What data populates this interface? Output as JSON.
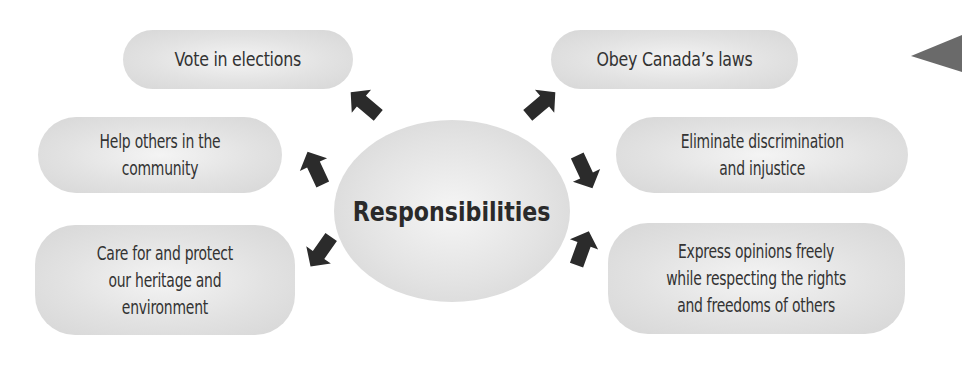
{
  "diagram": {
    "center": {
      "label": "Responsibilities"
    },
    "left": [
      {
        "label": "Vote in elections"
      },
      {
        "label_lines": [
          "Help others in the",
          "community"
        ]
      },
      {
        "label_lines": [
          "Care for and protect",
          "our heritage and",
          "environment"
        ]
      }
    ],
    "right": [
      {
        "label": "Obey Canada’s laws"
      },
      {
        "label_lines": [
          "Eliminate discrimination",
          "and injustice"
        ]
      },
      {
        "label_lines": [
          "Express opinions freely",
          "while respecting the rights",
          "and freedoms of others"
        ]
      }
    ],
    "colors": {
      "bubble": "#e2e2e2",
      "text": "#333333",
      "arrow": "#2b2b2b",
      "nav_triangle": "#6a6a6a"
    }
  }
}
